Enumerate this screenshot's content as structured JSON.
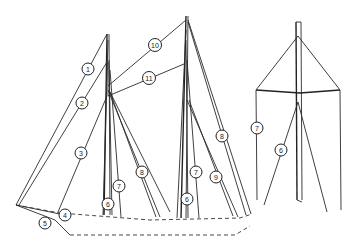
{
  "diagram": {
    "colors": {
      "line": "#2a2a2a",
      "background": "#ffffff"
    },
    "callouts": [
      {
        "id": "c1",
        "label": "1",
        "x": 88,
        "y": 69
      },
      {
        "id": "c2",
        "label": "2",
        "x": 82,
        "y": 103
      },
      {
        "id": "c3",
        "label": "3",
        "x": 81,
        "y": 153
      },
      {
        "id": "c4",
        "label": "4",
        "x": 65,
        "y": 215
      },
      {
        "id": "c5",
        "label": "5",
        "x": 45,
        "y": 223
      },
      {
        "id": "c6a",
        "label": "6",
        "x": 108,
        "y": 204
      },
      {
        "id": "c7a",
        "label": "7",
        "x": 119,
        "y": 186
      },
      {
        "id": "c8a",
        "label": "8",
        "x": 142,
        "y": 172
      },
      {
        "id": "c10",
        "label": "10",
        "x": 155,
        "y": 45
      },
      {
        "id": "c11",
        "label": "11",
        "x": 149,
        "y": 78
      },
      {
        "id": "c6b",
        "label": "6",
        "x": 187,
        "y": 199
      },
      {
        "id": "c7b",
        "label": "7",
        "x": 196,
        "y": 172
      },
      {
        "id": "c9",
        "label": "9",
        "x": 216,
        "y": 177
      },
      {
        "id": "c8b",
        "label": "8",
        "x": 222,
        "y": 136
      },
      {
        "id": "c7c",
        "label": "7",
        "x": 257,
        "y": 128
      },
      {
        "id": "c6c",
        "label": "6",
        "x": 281,
        "y": 150
      }
    ]
  }
}
